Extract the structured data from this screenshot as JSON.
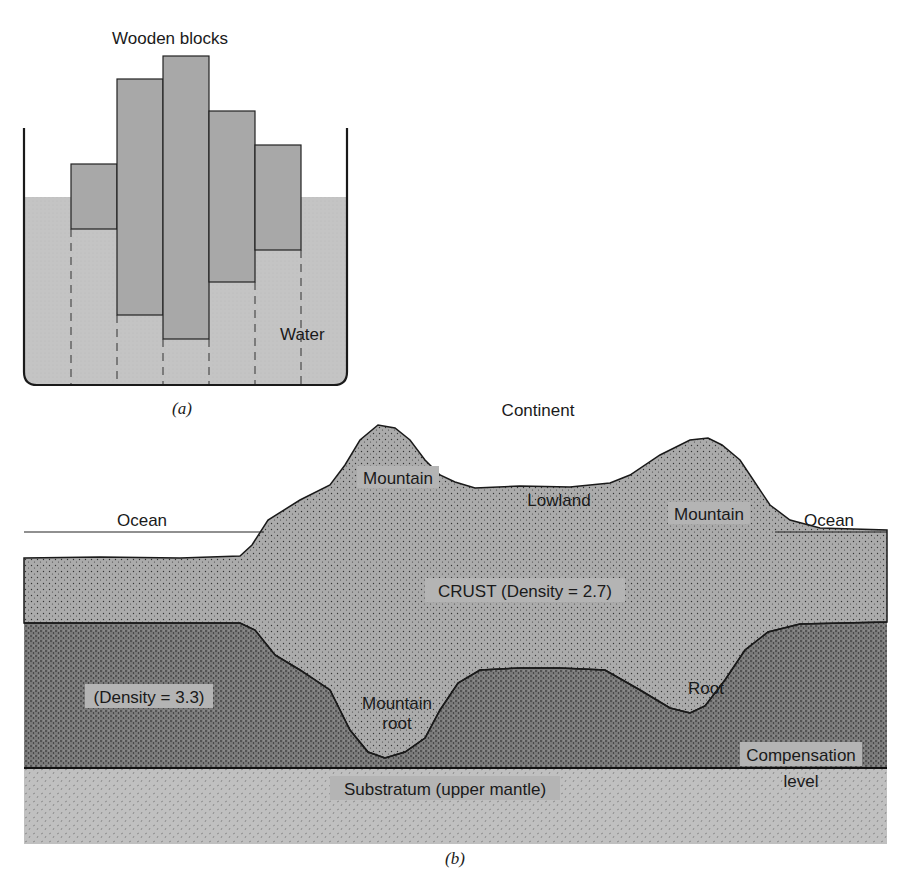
{
  "panel_a": {
    "title": "Wooden blocks",
    "water_label": "Water",
    "caption": "(a)",
    "colors": {
      "water": "#c2c2c2",
      "block": "#a9a9a9",
      "outline": "#222222"
    },
    "blocks": [
      {
        "x": 71,
        "top": 164,
        "bottom": 229,
        "width": 46
      },
      {
        "x": 117,
        "top": 79,
        "bottom": 315,
        "width": 46
      },
      {
        "x": 163,
        "top": 56,
        "bottom": 339,
        "width": 46
      },
      {
        "x": 209,
        "top": 111,
        "bottom": 282,
        "width": 46
      },
      {
        "x": 255,
        "top": 145,
        "bottom": 250,
        "width": 46
      }
    ]
  },
  "panel_b": {
    "continent_label": "Continent",
    "ocean_left_label": "Ocean",
    "ocean_right_label": "Ocean",
    "mountain_left_label": "Mountain",
    "lowland_label": "Lowland",
    "mountain_right_label": "Mountain",
    "crust_label": "CRUST (Density = 2.7)",
    "mantle_density_label": "(Density = 3.3)",
    "mountain_root_line1": "Mountain",
    "mountain_root_line2": "root",
    "root_label": "Root",
    "compensation_line1": "Compensation",
    "compensation_line2": "level",
    "substratum_label": "Substratum (upper mantle)",
    "caption": "(b)",
    "colors": {
      "crust": "#a8a8a8",
      "mantle": "#7e7e7e",
      "substratum": "#bdbdbd",
      "outline": "#1a1a1a"
    }
  }
}
